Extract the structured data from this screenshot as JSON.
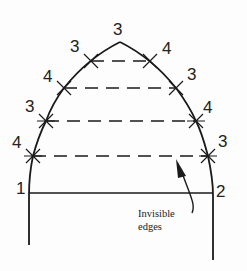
{
  "diagram": {
    "title": "",
    "point_labels": {
      "apex": "3",
      "left": [
        "3",
        "4",
        "3",
        "4"
      ],
      "right": [
        "4",
        "3",
        "4",
        "3"
      ],
      "base_left": "1",
      "base_right": "2"
    },
    "annotation": {
      "line1": "Invisible",
      "line2": "edges"
    },
    "colors": {
      "stroke": "#1a1a1a",
      "background": "#fdfdfd"
    }
  }
}
